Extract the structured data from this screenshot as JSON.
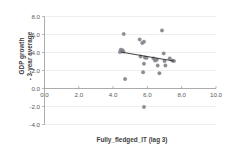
{
  "chart_data": {
    "type": "scatter",
    "title": "",
    "xlabel": "Fully_fledged_IT (lag 3)",
    "ylabel": "GDP growth\n- 3-year average",
    "ylabel_line1": "GDP growth",
    "ylabel_line2": "- 3-year average",
    "xlim": [
      0.0,
      10.0
    ],
    "ylim": [
      -4.0,
      8.0
    ],
    "xticks": [
      "0.0",
      "2.0",
      "4.0",
      "6.0",
      "8.0",
      "10.0"
    ],
    "xtick_values": [
      0.0,
      2.0,
      4.0,
      6.0,
      8.0,
      10.0
    ],
    "yticks": [
      "8.0",
      "6.0",
      "4.0",
      "2.0",
      "0.0",
      "-2.0",
      "-4.0"
    ],
    "ytick_values": [
      8.0,
      6.0,
      4.0,
      2.0,
      0.0,
      -2.0,
      -4.0
    ],
    "grid": true,
    "grid_axis": "y",
    "legend": "none",
    "marker_color": "#8e8e96",
    "trendline_color": "#2b2b2b",
    "gridline_color": "#e2e2e2",
    "axis_color": "#9a9a9a",
    "points": [
      {
        "x": 4.45,
        "y": 4.3
      },
      {
        "x": 4.55,
        "y": 4.25
      },
      {
        "x": 4.4,
        "y": 4.05
      },
      {
        "x": 4.6,
        "y": 4.1
      },
      {
        "x": 4.62,
        "y": 6.05
      },
      {
        "x": 4.7,
        "y": 1.05
      },
      {
        "x": 5.55,
        "y": 5.45
      },
      {
        "x": 5.7,
        "y": 5.05
      },
      {
        "x": 5.8,
        "y": 5.2
      },
      {
        "x": 5.6,
        "y": 3.55
      },
      {
        "x": 5.85,
        "y": 3.45
      },
      {
        "x": 5.95,
        "y": 3.4
      },
      {
        "x": 5.8,
        "y": 2.75
      },
      {
        "x": 5.75,
        "y": 1.8
      },
      {
        "x": 5.8,
        "y": -2.05
      },
      {
        "x": 6.35,
        "y": 3.35
      },
      {
        "x": 6.45,
        "y": 3.1
      },
      {
        "x": 6.55,
        "y": 3.2
      },
      {
        "x": 6.6,
        "y": 2.55
      },
      {
        "x": 6.7,
        "y": 1.7
      },
      {
        "x": 6.85,
        "y": 6.45
      },
      {
        "x": 6.95,
        "y": 3.9
      },
      {
        "x": 7.0,
        "y": 3.05
      },
      {
        "x": 7.05,
        "y": 2.55
      },
      {
        "x": 7.3,
        "y": 3.35
      },
      {
        "x": 7.45,
        "y": 3.1
      },
      {
        "x": 7.55,
        "y": 3.05
      }
    ],
    "trendline": {
      "x0": 4.45,
      "y0": 4.05,
      "x1": 7.55,
      "y1": 3.05
    }
  }
}
